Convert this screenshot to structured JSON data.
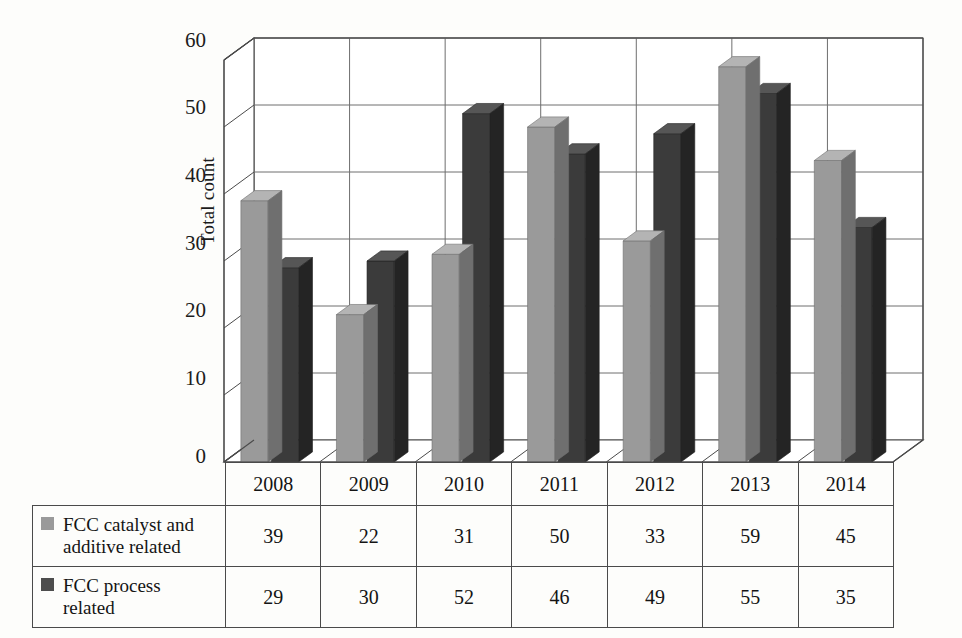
{
  "chart_data": {
    "type": "bar",
    "title": "",
    "subtitle": "",
    "xlabel": "",
    "ylabel": "Total count",
    "ylim": [
      0,
      60
    ],
    "ytick_step": 10,
    "yticks": [
      60,
      50,
      40,
      30,
      20,
      10,
      0
    ],
    "grid": true,
    "legend_position": "table-left",
    "three_d": true,
    "categories": [
      "2008",
      "2009",
      "2010",
      "2011",
      "2012",
      "2013",
      "2014"
    ],
    "series": [
      {
        "name": "FCC catalyst and additive related",
        "name_line1": "FCC catalyst and",
        "name_line2": "additive related",
        "color": "#9a9a9a",
        "top_color": "#b4b4b4",
        "side_color": "#6f6f6f",
        "swatch": "swatch-light",
        "values": [
          39,
          22,
          31,
          50,
          33,
          59,
          45
        ]
      },
      {
        "name": "FCC process related",
        "name_line1": "FCC process",
        "name_line2": "related",
        "color": "#3b3b3b",
        "top_color": "#565656",
        "side_color": "#242424",
        "swatch": "swatch-dark",
        "values": [
          29,
          30,
          52,
          46,
          49,
          55,
          35
        ]
      }
    ]
  },
  "axis": {
    "y_title": "Total count",
    "tick_60": "60",
    "tick_50": "50",
    "tick_40": "40",
    "tick_30": "30",
    "tick_20": "20",
    "tick_10": "10",
    "tick_0": "0"
  },
  "table": {
    "year_headers": [
      "2008",
      "2009",
      "2010",
      "2011",
      "2012",
      "2013",
      "2014"
    ],
    "rows": [
      {
        "label_line1": "FCC catalyst and",
        "label_line2": "additive related",
        "swatch_class": "swatch-light",
        "values": [
          "39",
          "22",
          "31",
          "50",
          "33",
          "59",
          "45"
        ]
      },
      {
        "label_line1": "FCC process",
        "label_line2": "related",
        "swatch_class": "swatch-dark",
        "values": [
          "29",
          "30",
          "52",
          "46",
          "49",
          "55",
          "35"
        ]
      }
    ]
  },
  "colors": {
    "series1": "#9a9a9a",
    "series2": "#3b3b3b",
    "gridline": "#6e6e6e",
    "axis": "#4a4a4a",
    "background": "#fdfdfb",
    "text": "#141414"
  }
}
